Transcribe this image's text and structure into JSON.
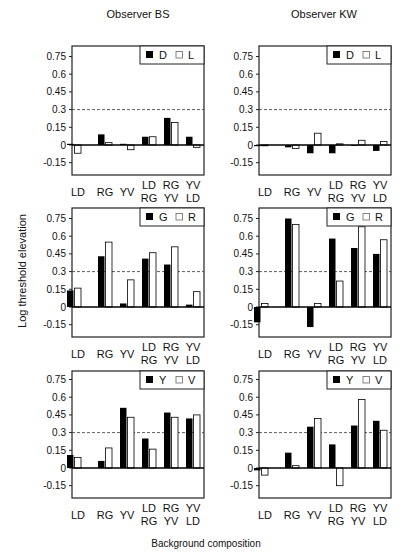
{
  "figure": {
    "col_titles": [
      "Observer BS",
      "Observer KW"
    ],
    "ylabel": "Log  threshold elevation",
    "xlabel": "Background composition"
  },
  "colors": {
    "filled": "#000000",
    "open": "#ffffff",
    "stroke": "#222222",
    "dashed": "#333333"
  },
  "chart_data": [
    {
      "type": "bar",
      "title": "Observer BS",
      "panel": "D/L",
      "categories": [
        "LD",
        "RG",
        "YV",
        "LD RG",
        "RG YV",
        "YV LD"
      ],
      "series": [
        {
          "name": "D",
          "fill": "filled",
          "values": [
            0.01,
            0.09,
            0.01,
            0.07,
            0.23,
            0.07
          ]
        },
        {
          "name": "L",
          "fill": "open",
          "values": [
            -0.07,
            0.02,
            -0.04,
            0.07,
            0.19,
            -0.02
          ]
        }
      ],
      "yticks": [
        0.75,
        0.6,
        0.45,
        0.3,
        0.15,
        0,
        -0.15
      ],
      "ylim": [
        -0.25,
        0.85
      ],
      "reference_line": 0.3,
      "xlabel": "Background composition",
      "ylabel": "Log threshold elevation"
    },
    {
      "type": "bar",
      "title": "Observer KW",
      "panel": "D/L",
      "categories": [
        "LD",
        "RG",
        "YV",
        "LD RG",
        "RG YV",
        "YV LD"
      ],
      "series": [
        {
          "name": "D",
          "fill": "filled",
          "values": [
            -0.01,
            -0.02,
            -0.07,
            -0.07,
            0.0,
            -0.05
          ]
        },
        {
          "name": "L",
          "fill": "open",
          "values": [
            0.0,
            -0.03,
            0.1,
            0.01,
            0.04,
            0.03
          ]
        }
      ],
      "yticks": [
        0.75,
        0.6,
        0.45,
        0.3,
        0.15,
        0,
        -0.15
      ],
      "ylim": [
        -0.25,
        0.85
      ],
      "reference_line": 0.3,
      "xlabel": "Background composition",
      "ylabel": "Log threshold elevation"
    },
    {
      "type": "bar",
      "title": "Observer BS",
      "panel": "G/R",
      "categories": [
        "LD",
        "RG",
        "YV",
        "LD RG",
        "RG YV",
        "YV LD"
      ],
      "series": [
        {
          "name": "G",
          "fill": "filled",
          "values": [
            0.14,
            0.43,
            0.03,
            0.41,
            0.36,
            0.02
          ]
        },
        {
          "name": "R",
          "fill": "open",
          "values": [
            0.16,
            0.55,
            0.23,
            0.46,
            0.51,
            0.13
          ]
        }
      ],
      "yticks": [
        0.75,
        0.6,
        0.45,
        0.3,
        0.15,
        0,
        -0.15
      ],
      "ylim": [
        -0.25,
        0.85
      ],
      "reference_line": 0.3,
      "xlabel": "Background composition",
      "ylabel": "Log threshold elevation"
    },
    {
      "type": "bar",
      "title": "Observer KW",
      "panel": "G/R",
      "categories": [
        "LD",
        "RG",
        "YV",
        "LD RG",
        "RG YV",
        "YV LD"
      ],
      "series": [
        {
          "name": "G",
          "fill": "filled",
          "values": [
            -0.13,
            0.75,
            -0.17,
            0.58,
            0.5,
            0.45
          ]
        },
        {
          "name": "R",
          "fill": "open",
          "values": [
            0.03,
            0.7,
            0.03,
            0.22,
            0.68,
            0.57
          ]
        }
      ],
      "yticks": [
        0.75,
        0.6,
        0.45,
        0.3,
        0.15,
        0,
        -0.15
      ],
      "ylim": [
        -0.25,
        0.85
      ],
      "reference_line": 0.3,
      "xlabel": "Background composition",
      "ylabel": "Log threshold elevation"
    },
    {
      "type": "bar",
      "title": "Observer BS",
      "panel": "Y/V",
      "categories": [
        "LD",
        "RG",
        "YV",
        "LD RG",
        "RG YV",
        "YV LD"
      ],
      "series": [
        {
          "name": "Y",
          "fill": "filled",
          "values": [
            0.11,
            0.06,
            0.51,
            0.25,
            0.47,
            0.42
          ]
        },
        {
          "name": "V",
          "fill": "open",
          "values": [
            0.09,
            0.17,
            0.43,
            0.16,
            0.43,
            0.45
          ]
        }
      ],
      "yticks": [
        0.75,
        0.6,
        0.45,
        0.3,
        0.15,
        0,
        -0.15
      ],
      "ylim": [
        -0.25,
        0.85
      ],
      "reference_line": 0.3,
      "xlabel": "Background composition",
      "ylabel": "Log threshold elevation"
    },
    {
      "type": "bar",
      "title": "Observer KW",
      "panel": "Y/V",
      "categories": [
        "LD",
        "RG",
        "YV",
        "LD RG",
        "RG YV",
        "YV LD"
      ],
      "series": [
        {
          "name": "Y",
          "fill": "filled",
          "values": [
            -0.02,
            0.13,
            0.35,
            0.2,
            0.36,
            0.4
          ]
        },
        {
          "name": "V",
          "fill": "open",
          "values": [
            -0.06,
            0.02,
            0.42,
            -0.15,
            0.58,
            0.32
          ]
        }
      ],
      "yticks": [
        0.75,
        0.6,
        0.45,
        0.3,
        0.15,
        0,
        -0.15
      ],
      "ylim": [
        -0.25,
        0.85
      ],
      "reference_line": 0.3,
      "xlabel": "Background composition",
      "ylabel": "Log threshold elevation"
    }
  ]
}
